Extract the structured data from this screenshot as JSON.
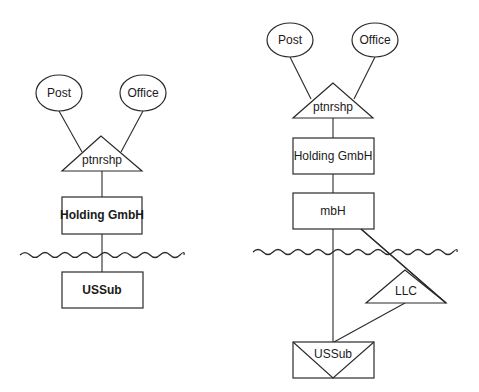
{
  "diagrams": [
    {
      "id": "left",
      "nodes": {
        "post": {
          "label": "Post",
          "shape": "ellipse"
        },
        "office": {
          "label": "Office",
          "shape": "ellipse"
        },
        "ptnrshp": {
          "label": "ptnrshp",
          "shape": "triangle"
        },
        "holding": {
          "label": "Holding GmbH",
          "shape": "rectangle"
        },
        "ussub": {
          "label": "USSub",
          "shape": "rectangle"
        }
      },
      "edges": [
        [
          "post",
          "ptnrshp"
        ],
        [
          "office",
          "ptnrshp"
        ],
        [
          "ptnrshp",
          "holding"
        ],
        [
          "holding",
          "ussub"
        ]
      ],
      "border": "wavy-line between Holding GmbH and USSub"
    },
    {
      "id": "right",
      "nodes": {
        "post": {
          "label": "Post",
          "shape": "ellipse"
        },
        "office": {
          "label": "Office",
          "shape": "ellipse"
        },
        "ptnrshp": {
          "label": "ptnrshp",
          "shape": "triangle"
        },
        "holding": {
          "label": "Holding GmbH",
          "shape": "rectangle"
        },
        "mbh": {
          "label": "mbH",
          "shape": "rectangle"
        },
        "llc": {
          "label": "LLC",
          "shape": "triangle"
        },
        "ussub": {
          "label": "USSub",
          "shape": "rectangle-with-inverted-triangle"
        }
      },
      "edges": [
        [
          "post",
          "ptnrshp"
        ],
        [
          "office",
          "ptnrshp"
        ],
        [
          "ptnrshp",
          "holding"
        ],
        [
          "holding",
          "mbh"
        ],
        [
          "mbh",
          "ussub"
        ],
        [
          "mbh",
          "llc"
        ],
        [
          "llc",
          "ussub"
        ]
      ],
      "border": "wavy-line between mbH and LLC/USSub"
    }
  ]
}
